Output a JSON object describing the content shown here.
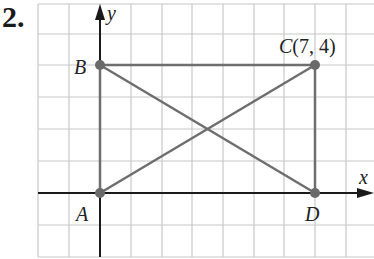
{
  "problem_number": "2.",
  "axes": {
    "x_label": "x",
    "y_label": "y"
  },
  "points": [
    {
      "name": "A",
      "x": 0,
      "y": 0,
      "label": "A"
    },
    {
      "name": "B",
      "x": 0,
      "y": 4,
      "label": "B"
    },
    {
      "name": "C",
      "x": 7,
      "y": 4,
      "label": "C(7, 4)"
    },
    {
      "name": "D",
      "x": 7,
      "y": 0,
      "label": "D"
    }
  ],
  "segments": [
    {
      "from": "A",
      "to": "B"
    },
    {
      "from": "B",
      "to": "C"
    },
    {
      "from": "C",
      "to": "D"
    },
    {
      "from": "A",
      "to": "C"
    },
    {
      "from": "B",
      "to": "D"
    }
  ],
  "grid": {
    "x_range": [
      -2,
      9
    ],
    "y_range": [
      -2,
      6
    ]
  },
  "colors": {
    "grid": "#c8c8c8",
    "axis": "#1a1a1a",
    "shape": "#6e6e6e",
    "point": "#6a6a6a"
  }
}
